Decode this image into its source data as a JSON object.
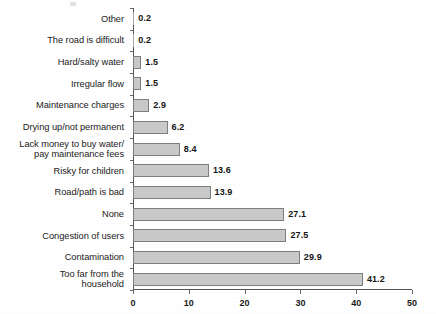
{
  "chart_data": {
    "type": "bar",
    "orientation": "horizontal",
    "title": "",
    "subtitle": "",
    "xlabel": "",
    "ylabel": "",
    "xlim": [
      0,
      50
    ],
    "xticks": [
      "0",
      "10",
      "20",
      "30",
      "40",
      "50"
    ],
    "grid": false,
    "legend": null,
    "bar_color": "#c9c9c9",
    "bar_border_color": "#7e7e7e",
    "categories": [
      "Other",
      "The road is difficult",
      "Hard/salty water",
      "Irregular flow",
      "Maintenance charges",
      "Drying up/not permanent",
      "Lack money to buy water/\npay maintenance fees",
      "Risky for children",
      "Road/path is bad",
      "None",
      "Congestion of users",
      "Contamination",
      "Too far from the\nhousehold"
    ],
    "values": [
      0.2,
      0.2,
      1.5,
      1.5,
      2.9,
      6.2,
      8.4,
      13.6,
      13.9,
      27.1,
      27.5,
      29.9,
      41.2
    ],
    "value_labels": [
      "0.2",
      "0.2",
      "1.5",
      "1.5",
      "2.9",
      "6.2",
      "8.4",
      "13.6",
      "13.9",
      "27.1",
      "27.5",
      "29.9",
      "41.2"
    ]
  }
}
